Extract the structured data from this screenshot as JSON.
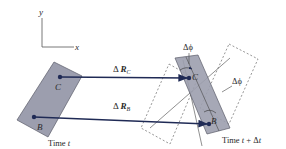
{
  "axes": {
    "x_label": "x",
    "y_label": "y"
  },
  "body_initial": {
    "point_c_label": "C",
    "point_b_label": "B",
    "time_label": "Time ",
    "time_var": "t"
  },
  "body_final": {
    "point_c_label": "C",
    "point_b_label": "B",
    "time_label": "Time ",
    "time_expr_var": "t",
    "time_expr_rest": " + Δ",
    "time_expr_var2": "t"
  },
  "displacements": {
    "delta_symbol": "Δ ",
    "rc_letter": "R",
    "rc_sub": "C",
    "rb_letter": "R",
    "rb_sub": "B"
  },
  "angles": {
    "top_label": "Δϕ",
    "right_label": "Δϕ"
  },
  "colors": {
    "body_fill": "#9c9eae",
    "body_stroke": "#5a5c68",
    "arrow": "#1f2a55",
    "axis": "#555555",
    "dashed": "#6a6a6a"
  }
}
